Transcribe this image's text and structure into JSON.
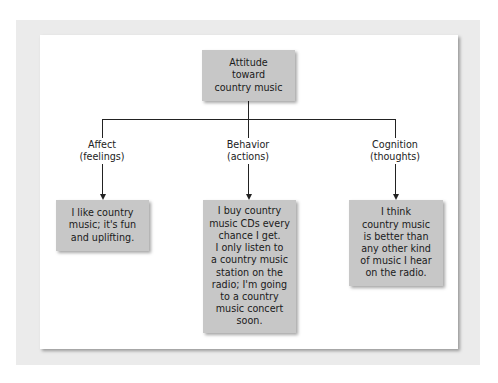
{
  "diagram": {
    "root": {
      "label": "Attitude\ntoward\ncountry music"
    },
    "branches": [
      {
        "category": "Affect\n(feelings)",
        "example": "I like country\nmusic; it's fun\nand uplifting."
      },
      {
        "category": "Behavior\n(actions)",
        "example": "I buy country\nmusic CDs every\nchance I get.\nI only listen to\na country music\nstation on the\nradio; I'm going\nto a country\nmusic concert\nsoon."
      },
      {
        "category": "Cognition\n(thoughts)",
        "example": "I think\ncountry music\nis better than\nany other kind\nof music I hear\non the radio."
      }
    ],
    "colors": {
      "frame": "#ebebeb",
      "panel": "#ffffff",
      "box": "#c7c7c7",
      "line": "#222222"
    }
  }
}
